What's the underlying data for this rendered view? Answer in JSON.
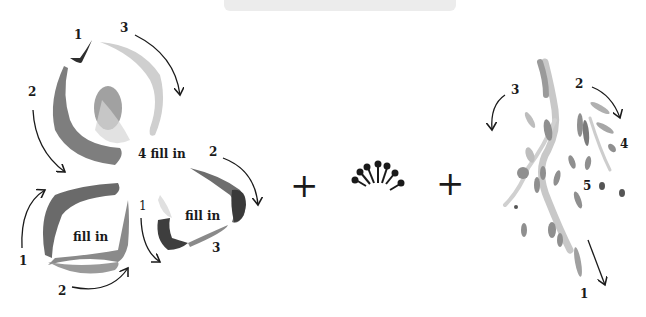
{
  "figure": {
    "type": "brush-stroke instructional diagram",
    "colors": {
      "ink_dark": "#3a3a3a",
      "ink_mid": "#7a7a7a",
      "ink_light": "#bdbdbd",
      "wash": "#d9d9d9",
      "text": "#1a1a1a"
    }
  },
  "petal_top": {
    "labels": {
      "s1": "1",
      "s2": "2",
      "s3": "3",
      "s4": "4 fill in"
    }
  },
  "petal_left": {
    "labels": {
      "s1": "1",
      "s2": "2",
      "fill": "fill in"
    }
  },
  "petal_right": {
    "labels": {
      "s1": "1",
      "s2": "2",
      "s3": "3",
      "fill": "fill in"
    }
  },
  "operators": {
    "plus1": "+",
    "plus2": "+"
  },
  "foliage": {
    "labels": {
      "s1": "1",
      "s2": "2",
      "s3": "3",
      "s4": "4",
      "s5": "5"
    }
  }
}
